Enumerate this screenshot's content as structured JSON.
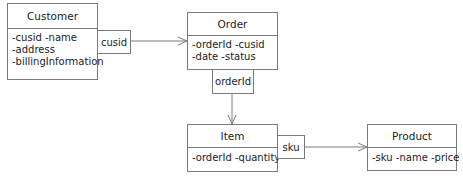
{
  "diagram": {
    "type": "uml-class-diagram",
    "classes": [
      {
        "id": "customer",
        "name": "Customer",
        "attributes": [
          "-cusid -name",
          "-address",
          "-billingInformation"
        ]
      },
      {
        "id": "order",
        "name": "Order",
        "attributes": [
          "-orderId -cusid",
          "-date -status"
        ]
      },
      {
        "id": "item",
        "name": "Item",
        "attributes": [
          "-orderId -quantity"
        ]
      },
      {
        "id": "product",
        "name": "Product",
        "attributes": [
          "-sku -name -price"
        ]
      }
    ],
    "associations": [
      {
        "from": "Customer",
        "to": "Order",
        "qualifier": "cusid"
      },
      {
        "from": "Order",
        "to": "Item",
        "qualifier": "orderId"
      },
      {
        "from": "Item",
        "to": "Product",
        "qualifier": "sku"
      }
    ]
  },
  "colors": {
    "line": "#7a7a7a",
    "background": "#ffffff",
    "text": "#222222"
  }
}
